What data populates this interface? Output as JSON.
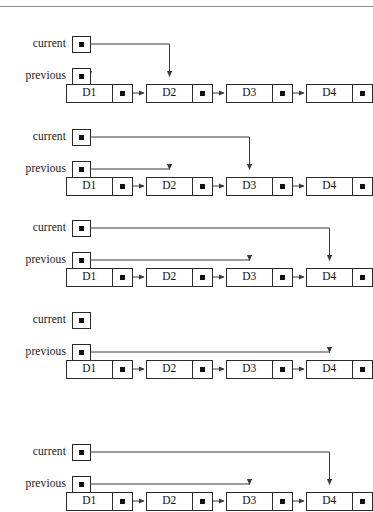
{
  "figure": {
    "type": "diagram",
    "width": 373,
    "height": 512,
    "background": "#ffffff",
    "line_color": "#3a3a3a",
    "text_color": "#111111",
    "rule_color": "#8d8d8d",
    "has_top_rule": true
  },
  "labels": {
    "current": "current",
    "previous": "previous",
    "pointer_dot": "pointer-dot-icon",
    "null_marker": "pointer-dot-icon"
  },
  "list": {
    "nodes": [
      {
        "id": "n1",
        "data": "D1"
      },
      {
        "id": "n2",
        "data": "D2"
      },
      {
        "id": "n3",
        "data": "D3"
      },
      {
        "id": "n4",
        "data": "D4"
      }
    ],
    "node_x": [
      66,
      146,
      226,
      306
    ],
    "node_width": 67,
    "data_width": 47,
    "link_width": 20
  },
  "steps": [
    {
      "index": 1,
      "label_current": "current",
      "label_previous": "previous",
      "current_target": "D2",
      "previous_target": "D1",
      "current_y": 44,
      "previous_y": 76,
      "nodes_y": 93
    },
    {
      "index": 2,
      "label_current": "current",
      "label_previous": "previous",
      "current_target": "D3",
      "previous_target": "D2",
      "current_y": 137,
      "previous_y": 169,
      "nodes_y": 186
    },
    {
      "index": 3,
      "label_current": "current",
      "label_previous": "previous",
      "current_target": "D4",
      "previous_target": "D3",
      "current_y": 228,
      "previous_y": 260,
      "nodes_y": 277
    },
    {
      "index": 4,
      "label_current": "current",
      "label_previous": "previous",
      "current_target": null,
      "previous_target": "D4",
      "current_y": 320,
      "previous_y": 352,
      "nodes_y": 369
    },
    {
      "index": 5,
      "label_current": "current",
      "label_previous": "previous",
      "current_target": "D4",
      "previous_target": "D3",
      "current_y": 452,
      "previous_y": 484,
      "nodes_y": 501
    }
  ]
}
